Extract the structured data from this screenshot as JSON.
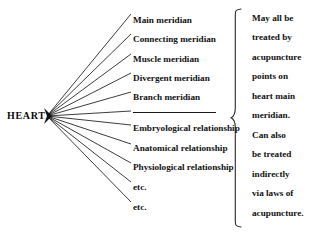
{
  "diagram": {
    "root": {
      "label": "HEART"
    },
    "divider": {
      "present": true
    },
    "branches": [
      {
        "label": "Main meridian",
        "y": 16
      },
      {
        "label": "Connecting meridian",
        "y": 35
      },
      {
        "label": "Muscle meridian",
        "y": 55
      },
      {
        "label": "Divergent meridian",
        "y": 74
      },
      {
        "label": "Branch meridian",
        "y": 93
      },
      {
        "label": "Embryological relationship",
        "y": 124
      },
      {
        "label": "Anatomical relationship",
        "y": 144
      },
      {
        "label": "Physiological relationship",
        "y": 163
      },
      {
        "label": "etc.",
        "y": 183
      },
      {
        "label": "etc.",
        "y": 203
      }
    ],
    "annotation": {
      "lines": [
        "May all be",
        "treated by",
        "acupuncture",
        "points on",
        "heart main",
        "meridian.",
        "Can also",
        "be treated",
        "indirectly",
        "via laws of",
        "acupuncture."
      ]
    },
    "colors": {
      "ink": "#111111",
      "background": "#ffffff",
      "line": "#1a1a1a"
    }
  }
}
